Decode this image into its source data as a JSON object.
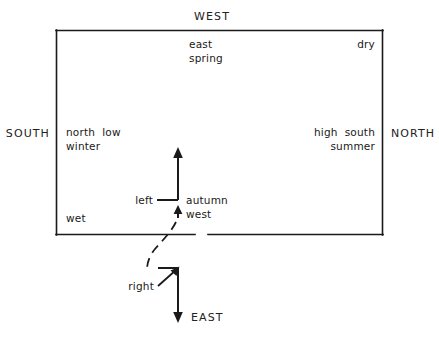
{
  "diagram": {
    "stroke_color": "#1a1a1a",
    "text_color": "#1a1a1a",
    "background_color": "#ffffff",
    "cardinals": {
      "west": "WEST",
      "south": "SOUTH",
      "north": "NORTH",
      "east": "EAST"
    },
    "inner_labels": {
      "top_center_line1": "east",
      "top_center_line2": "spring",
      "top_right": "dry",
      "left_line1": "north  low",
      "left_line2": "winter",
      "right_line1": "high  south",
      "right_line2": "summer",
      "bottom_left": "wet"
    },
    "arrow_labels": {
      "left": "left",
      "right": "right",
      "autumn": "autumn",
      "west_lower": "west"
    }
  }
}
